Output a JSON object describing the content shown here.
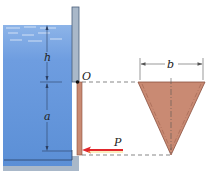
{
  "diagram": {
    "type": "hydrostatic-gate",
    "labels": {
      "h": "h",
      "a": "a",
      "O": "O",
      "b": "b",
      "P": "P"
    },
    "colors": {
      "water": "#5b8fd6",
      "water_light": "#8db4e8",
      "wall": "#a9b8c9",
      "wall_edge": "#4a5f7a",
      "gate": "#c98a73",
      "gate_edge": "#8a4f3e",
      "force_arrow": "#e0262b",
      "dims": "#2b3f63"
    },
    "elements": [
      "water-tank",
      "vertical-wall",
      "hinge-O",
      "triangular-gate-side-view",
      "triangular-gate-front-view",
      "force-P",
      "dimension-h",
      "dimension-a",
      "dimension-b"
    ]
  }
}
